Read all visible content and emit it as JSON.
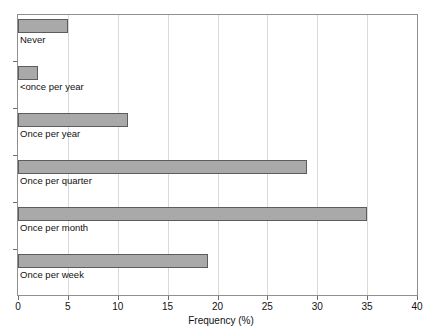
{
  "figure": {
    "title_remnant": "",
    "background_color": "#ffffff",
    "frame_color": "#8f8f8f",
    "grid_color": "#d9d9d9",
    "bar_fill_color": "#a9a9a9",
    "bar_edge_color": "#5c5c5c"
  },
  "chart_data": {
    "type": "bar",
    "orientation": "horizontal",
    "title": "",
    "xlabel": "Frequency (%)",
    "ylabel": "",
    "xlim": [
      0,
      40
    ],
    "xticks": [
      "0",
      "5",
      "10",
      "15",
      "20",
      "25",
      "30",
      "35",
      "40"
    ],
    "xtick_values": [
      0,
      5,
      10,
      15,
      20,
      25,
      30,
      35,
      40
    ],
    "grid": "vertical",
    "legend": "none",
    "categories": [
      "Never",
      "<once per year",
      "Once per year",
      "Once per quarter",
      "Once per month",
      "Once per week"
    ],
    "values": [
      5,
      2,
      11,
      29,
      35,
      19
    ],
    "series": [
      {
        "name": "Frequency",
        "values": [
          5,
          2,
          11,
          29,
          35,
          19
        ]
      }
    ]
  }
}
